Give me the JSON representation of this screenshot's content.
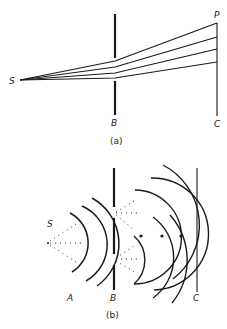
{
  "figure_a": {
    "labels": {
      "source": "S",
      "barrier": "B",
      "point": "P",
      "screen": "C"
    },
    "caption": "(a)",
    "ray_count": 4
  },
  "figure_b": {
    "labels": {
      "source": "S",
      "wavefronts": "A",
      "barrier": "B",
      "screen": "C"
    },
    "caption": "(b)",
    "slit_count": 2,
    "intersection_count": 3
  },
  "colors": {
    "ink": "#1a1a1a",
    "background": "#ffffff"
  }
}
